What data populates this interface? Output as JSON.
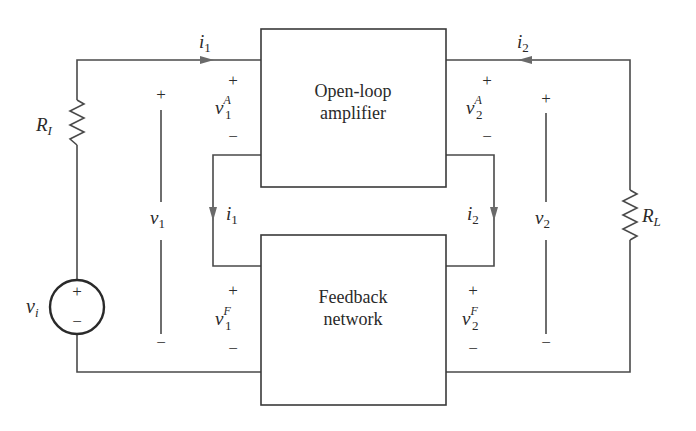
{
  "diagram": {
    "type": "feedback amplifier block diagram",
    "blocks": {
      "amplifier": {
        "line1": "Open-loop",
        "line2": "amplifier"
      },
      "feedback": {
        "line1": "Feedback",
        "line2": "network"
      }
    },
    "components": {
      "source": {
        "label": "v",
        "sub": "i",
        "plus": "+",
        "minus": "−"
      },
      "input_resistor": {
        "label": "R",
        "sub": "I"
      },
      "load_resistor": {
        "label": "R",
        "sub": "L"
      }
    },
    "currents": {
      "i1_top": {
        "label": "i",
        "sub": "1"
      },
      "i2_top": {
        "label": "i",
        "sub": "2"
      },
      "i1_loop": {
        "label": "i",
        "sub": "1"
      },
      "i2_loop": {
        "label": "i",
        "sub": "2"
      }
    },
    "voltages": {
      "v1": {
        "label": "v",
        "sub": "1",
        "plus": "+",
        "minus": "−"
      },
      "v2": {
        "label": "v",
        "sub": "2",
        "plus": "+",
        "minus": "−"
      },
      "v1A": {
        "label": "v",
        "sub": "1",
        "sup": "A",
        "plus": "+",
        "minus": "−"
      },
      "v2A": {
        "label": "v",
        "sub": "2",
        "sup": "A",
        "plus": "+",
        "minus": "−"
      },
      "v1F": {
        "label": "v",
        "sub": "1",
        "sup": "F",
        "plus": "+",
        "minus": "−"
      },
      "v2F": {
        "label": "v",
        "sub": "2",
        "sup": "F",
        "plus": "+",
        "minus": "−"
      }
    }
  }
}
